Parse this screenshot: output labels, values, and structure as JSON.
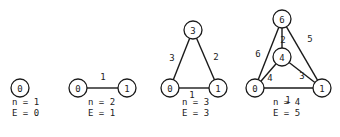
{
  "graphs": [
    {
      "id": "g1",
      "nodes": [
        {
          "label": "0",
          "x": 20,
          "y": 88
        }
      ],
      "edges": [],
      "caption": {
        "n_text": "n = 1",
        "e_text": "E = 0",
        "x": 12,
        "y_n": 105,
        "y_e": 116
      }
    },
    {
      "id": "g2",
      "nodes": [
        {
          "label": "0",
          "x": 78,
          "y": 88
        },
        {
          "label": "1",
          "x": 127,
          "y": 88
        }
      ],
      "edges": [
        {
          "from": 0,
          "to": 1,
          "label": "1",
          "lx": 103,
          "ly": 77
        }
      ],
      "caption": {
        "n_text": "n = 2",
        "e_text": "E = 1",
        "x": 88,
        "y_n": 105,
        "y_e": 116
      }
    },
    {
      "id": "g3",
      "nodes": [
        {
          "label": "3",
          "x": 193,
          "y": 30
        },
        {
          "label": "0",
          "x": 170,
          "y": 88
        },
        {
          "label": "1",
          "x": 218,
          "y": 88
        }
      ],
      "edges": [
        {
          "from": 1,
          "to": 0,
          "label": "3",
          "lx": 172,
          "ly": 58
        },
        {
          "from": 0,
          "to": 2,
          "label": "2",
          "lx": 216,
          "ly": 57
        },
        {
          "from": 1,
          "to": 2,
          "label": "1",
          "lx": 192,
          "ly": 95
        }
      ],
      "caption": {
        "n_text": "n = 3",
        "e_text": "E = 3",
        "x": 182,
        "y_n": 105,
        "y_e": 116
      }
    },
    {
      "id": "g4",
      "nodes": [
        {
          "label": "6",
          "x": 282,
          "y": 19
        },
        {
          "label": "4",
          "x": 282,
          "y": 57
        },
        {
          "label": "0",
          "x": 255,
          "y": 88
        },
        {
          "label": "1",
          "x": 322,
          "y": 88
        }
      ],
      "edges": [
        {
          "from": 0,
          "to": 2,
          "label": "6",
          "lx": 258,
          "ly": 54
        },
        {
          "from": 0,
          "to": 1,
          "label": "2",
          "lx": 283,
          "ly": 40
        },
        {
          "from": 0,
          "to": 3,
          "label": "5",
          "lx": 310,
          "ly": 39
        },
        {
          "from": 1,
          "to": 2,
          "label": "4",
          "lx": 270,
          "ly": 78
        },
        {
          "from": 1,
          "to": 3,
          "label": "3",
          "lx": 302,
          "ly": 76
        },
        {
          "from": 2,
          "to": 3,
          "label": "1",
          "lx": 288,
          "ly": 100
        }
      ],
      "caption": {
        "n_text": "n = 4",
        "e_text": "E = 5",
        "x": 273,
        "y_n": 105,
        "y_e": 116
      }
    }
  ],
  "node_radius": 9,
  "colors": {
    "stroke": "#1a1a1a",
    "text": "#222222",
    "background": "#ffffff"
  }
}
